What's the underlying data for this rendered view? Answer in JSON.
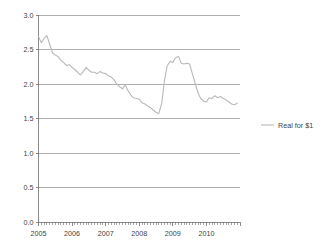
{
  "chart_data": {
    "type": "line",
    "title": "",
    "subtitle": "",
    "xlabel": "",
    "ylabel": "",
    "ylim": [
      0.0,
      3.0
    ],
    "xlim": [
      2005.0,
      2011.0
    ],
    "grid": true,
    "legend_position": "right",
    "y_ticks": [
      "0.0",
      "0.5",
      "1.0",
      "1.5",
      "2.0",
      "2.5",
      "3.0"
    ],
    "y_tick_values": [
      0.0,
      0.5,
      1.0,
      1.5,
      2.0,
      2.5,
      3.0
    ],
    "x_ticks": [
      "2005",
      "2006",
      "2007",
      "2008",
      "2009",
      "2010"
    ],
    "x_tick_values": [
      2005,
      2006,
      2007,
      2008,
      2009,
      2010
    ],
    "x_minor_tick_interval_months": 1,
    "line_color": "#b9b9b9",
    "gridline_color": "#8c8c8c",
    "axis_color": "#6e6e6e",
    "series": [
      {
        "name": "Real for $1",
        "color": "#b9b9b9",
        "x": [
          2005.0,
          2005.08,
          2005.17,
          2005.25,
          2005.33,
          2005.42,
          2005.5,
          2005.58,
          2005.67,
          2005.75,
          2005.83,
          2005.92,
          2006.0,
          2006.08,
          2006.17,
          2006.25,
          2006.33,
          2006.42,
          2006.5,
          2006.58,
          2006.67,
          2006.75,
          2006.83,
          2006.92,
          2007.0,
          2007.08,
          2007.17,
          2007.25,
          2007.33,
          2007.42,
          2007.5,
          2007.58,
          2007.67,
          2007.75,
          2007.83,
          2007.92,
          2008.0,
          2008.08,
          2008.17,
          2008.25,
          2008.33,
          2008.42,
          2008.5,
          2008.58,
          2008.67,
          2008.75,
          2008.83,
          2008.92,
          2009.0,
          2009.08,
          2009.17,
          2009.25,
          2009.33,
          2009.42,
          2009.5,
          2009.58,
          2009.67,
          2009.75,
          2009.83,
          2009.92,
          2010.0,
          2010.08,
          2010.17,
          2010.25,
          2010.33,
          2010.42,
          2010.5,
          2010.58,
          2010.67,
          2010.75,
          2010.83,
          2010.92
        ],
        "values": [
          2.69,
          2.6,
          2.66,
          2.7,
          2.58,
          2.45,
          2.42,
          2.4,
          2.34,
          2.31,
          2.27,
          2.28,
          2.24,
          2.21,
          2.17,
          2.13,
          2.18,
          2.24,
          2.2,
          2.17,
          2.17,
          2.15,
          2.18,
          2.16,
          2.15,
          2.12,
          2.1,
          2.06,
          2.0,
          1.96,
          1.93,
          1.99,
          1.9,
          1.84,
          1.8,
          1.79,
          1.78,
          1.73,
          1.71,
          1.68,
          1.66,
          1.62,
          1.59,
          1.57,
          1.72,
          2.05,
          2.26,
          2.33,
          2.31,
          2.38,
          2.4,
          2.3,
          2.29,
          2.3,
          2.29,
          2.15,
          2.0,
          1.87,
          1.79,
          1.75,
          1.74,
          1.8,
          1.79,
          1.83,
          1.8,
          1.82,
          1.79,
          1.77,
          1.74,
          1.71,
          1.7,
          1.72
        ]
      }
    ],
    "legend_entries": [
      {
        "label": "Real for $1",
        "color": "#b9b9b9"
      }
    ]
  },
  "legend": {
    "items": [
      {
        "label": "Real for $1"
      }
    ]
  }
}
